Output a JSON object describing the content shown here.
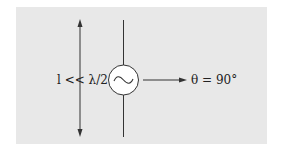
{
  "diagram": {
    "length_label": "l << λ/2",
    "angle_label": "θ = 90°",
    "source_symbol": "~",
    "colors": {
      "panel": "#e8e8e8",
      "stroke": "#333333",
      "source_fill": "#ffffff"
    }
  }
}
